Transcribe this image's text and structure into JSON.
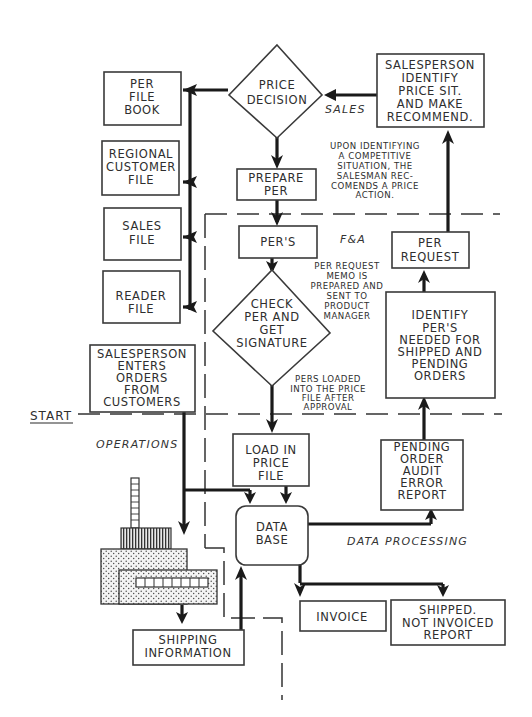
{
  "diagram": {
    "zones": {
      "sales": "SALES",
      "fa": "F&A",
      "operations": "OPERATIONS",
      "data_processing": "DATA PROCESSING",
      "start": "START"
    },
    "nodes": {
      "price_decision": [
        "PRICE",
        "DECISION"
      ],
      "salesperson_identify": [
        "SALESPERSON",
        "IDENTIFY",
        "PRICE SIT.",
        "AND MAKE",
        "RECOMMEND."
      ],
      "per_file_book": [
        "PER",
        "FILE",
        "BOOK"
      ],
      "regional_customer_file": [
        "REGIONAL",
        "CUSTOMER",
        "FILE"
      ],
      "sales_file": [
        "SALES",
        "FILE"
      ],
      "reader_file": [
        "READER",
        "FILE"
      ],
      "prepare_per": [
        "PREPARE",
        "PER"
      ],
      "pers": [
        "PER'S"
      ],
      "check_per": [
        "CHECK",
        "PER AND",
        "GET",
        "SIGNATURE"
      ],
      "per_request": [
        "PER",
        "REQUEST"
      ],
      "identify_pers": [
        "IDENTIFY",
        "PER'S",
        "NEEDED FOR",
        "SHIPPED AND",
        "PENDING",
        "ORDERS"
      ],
      "salesperson_enters": [
        "SALESPERSON",
        "ENTERS",
        "ORDERS",
        "FROM",
        "CUSTOMERS"
      ],
      "load_price_file": [
        "LOAD IN",
        "PRICE",
        "FILE"
      ],
      "pending_order_audit": [
        "PENDING",
        "ORDER",
        "AUDIT",
        "ERROR",
        "REPORT"
      ],
      "data_base": [
        "DATA",
        "BASE"
      ],
      "shipping_information": [
        "SHIPPING",
        "INFORMATION"
      ],
      "invoice": [
        "INVOICE"
      ],
      "shipped_not_invoiced": [
        "SHIPPED.",
        "NOT INVOICED",
        "REPORT"
      ]
    },
    "notes": {
      "competitive": [
        "UPON IDENTIFYING",
        "A COMPETITIVE",
        "SITUATION, THE",
        "SALESMAN REC-",
        "COMENDS A PRICE",
        "ACTION."
      ],
      "per_request_memo": [
        "PER REQUEST",
        "MEMO IS",
        "PREPARED AND",
        "SENT TO",
        "PRODUCT",
        "MANAGER"
      ],
      "pers_loaded": [
        "PERS LOADED",
        "INTO THE PRICE",
        "FILE AFTER",
        "APPROVAL"
      ]
    },
    "colors": {
      "ink": "#1a1a1a",
      "paper": "#ffffff"
    }
  }
}
